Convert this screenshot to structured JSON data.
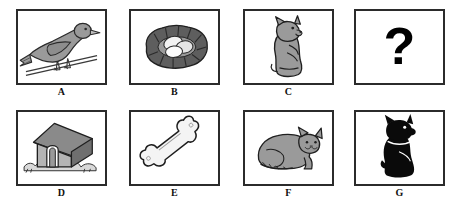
{
  "worksheet": {
    "type": "picture-analogy-puzzle",
    "width": 451,
    "height": 201,
    "background_color": "#ffffff",
    "border_color": "#2b2b2b",
    "rows": 2,
    "columns": 4
  },
  "palette": {
    "ink": "#1a1a1a",
    "panel_border": "#2b2b2b",
    "mid_gray": "#9a9a9a",
    "light_gray": "#c8c8c8",
    "dark_gray": "#5e5e5e",
    "near_black": "#0a0a0a",
    "white": "#ffffff",
    "egg_white": "#f2f2f2"
  },
  "panels": [
    {
      "id": "A",
      "label": "A",
      "icon": "bird-on-branch-icon",
      "description": "Gray bird perched on a branch",
      "x": 16,
      "y": 9,
      "width": 91,
      "height": 76,
      "fill": "#9a9a9a",
      "has_label": true
    },
    {
      "id": "B",
      "label": "B",
      "icon": "nest-with-eggs-icon",
      "description": "Dark gray nest holding white eggs",
      "x": 129,
      "y": 9,
      "width": 91,
      "height": 76,
      "fill": "#5e5e5e",
      "has_label": true
    },
    {
      "id": "C",
      "label": "C",
      "icon": "sitting-kitten-icon",
      "description": "Gray kitten sitting upright",
      "x": 243,
      "y": 9,
      "width": 91,
      "height": 76,
      "fill": "#9a9a9a",
      "has_label": true
    },
    {
      "id": "Q",
      "label": "?",
      "icon": "question-mark-icon",
      "description": "Empty panel with a bold question mark",
      "x": 354,
      "y": 9,
      "width": 91,
      "height": 76,
      "fill": "#000000",
      "has_label": false
    },
    {
      "id": "D",
      "label": "D",
      "icon": "dog-house-icon",
      "description": "Gray dog house on grass",
      "x": 16,
      "y": 110,
      "width": 91,
      "height": 76,
      "fill": "#9a9a9a",
      "has_label": true
    },
    {
      "id": "E",
      "label": "E",
      "icon": "bone-icon",
      "description": "White bone angled diagonally",
      "x": 129,
      "y": 110,
      "width": 91,
      "height": 76,
      "fill": "#f4f4f4",
      "has_label": true
    },
    {
      "id": "F",
      "label": "F",
      "icon": "lying-cat-icon",
      "description": "Gray cat lying down",
      "x": 243,
      "y": 110,
      "width": 91,
      "height": 76,
      "fill": "#9a9a9a",
      "has_label": true
    },
    {
      "id": "G",
      "label": "G",
      "icon": "black-dog-silhouette-icon",
      "description": "Black scottie dog silhouette with collar",
      "x": 354,
      "y": 110,
      "width": 91,
      "height": 76,
      "fill": "#0a0a0a",
      "has_label": true
    }
  ],
  "question": {
    "glyph": "?",
    "panel_id": "Q"
  }
}
